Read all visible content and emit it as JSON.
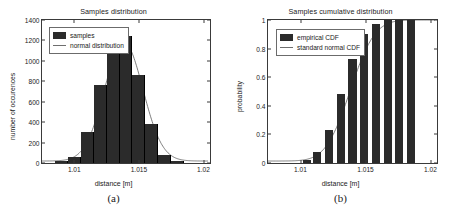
{
  "figure": {
    "background": "#ffffff",
    "bar_color": "#2b2b2b",
    "curve_color": "#6e6e6e",
    "axis_color": "#3a3a3a"
  },
  "panels": [
    {
      "caption": "(a)",
      "title": "Samples distribution",
      "legend": [
        {
          "label": "samples",
          "marker": "filled-square"
        },
        {
          "label": "normal distribution",
          "marker": "line"
        }
      ]
    },
    {
      "caption": "(b)",
      "title": "Samples cumulative distribution",
      "legend": [
        {
          "label": "empirical CDF",
          "marker": "filled-square"
        },
        {
          "label": "standard normal CDF",
          "marker": "line"
        }
      ]
    }
  ],
  "chart_data": [
    {
      "type": "bar",
      "title": "Samples distribution",
      "xlabel": "distance [m]",
      "ylabel": "number of occurences",
      "xlim": [
        1.0075,
        1.0205
      ],
      "ylim": [
        0,
        1400
      ],
      "xticks": [
        1.01,
        1.015,
        1.02
      ],
      "xticklabels": [
        "1.01",
        "1.015",
        "1.02"
      ],
      "yticks": [
        0,
        200,
        400,
        600,
        800,
        1000,
        1200,
        1400
      ],
      "yticklabels": [
        "0",
        "200",
        "400",
        "600",
        "800",
        "1000",
        "1200",
        "1400"
      ],
      "grid": false,
      "legend_position": "upper-left",
      "bin_edges": [
        1.0085,
        1.0095,
        1.0105,
        1.0115,
        1.0125,
        1.0135,
        1.0145,
        1.0155,
        1.0165,
        1.0175,
        1.0185
      ],
      "bin_centers": [
        1.009,
        1.01,
        1.011,
        1.012,
        1.013,
        1.014,
        1.015,
        1.016,
        1.017,
        1.018
      ],
      "values": [
        20,
        55,
        300,
        760,
        1240,
        1240,
        860,
        380,
        80,
        20
      ],
      "series": [
        {
          "name": "samples",
          "type": "bar",
          "values": [
            20,
            55,
            300,
            760,
            1240,
            1240,
            860,
            380,
            80,
            20
          ]
        },
        {
          "name": "normal distribution",
          "type": "line",
          "mean": 1.0139,
          "sigma": 0.0015,
          "peak": 1180
        }
      ]
    },
    {
      "type": "bar",
      "title": "Samples cumulative distribution",
      "xlabel": "distance [m]",
      "ylabel": "probability",
      "xlim": [
        1.0075,
        1.0205
      ],
      "ylim": [
        0,
        1
      ],
      "xticks": [
        1.01,
        1.015,
        1.02
      ],
      "xticklabels": [
        "1.01",
        "1.015",
        "1.02"
      ],
      "yticks": [
        0,
        0.2,
        0.4,
        0.6,
        0.8,
        1
      ],
      "yticklabels": [
        "0",
        "0.2",
        "0.4",
        "0.6",
        "0.8",
        "1"
      ],
      "grid": false,
      "legend_position": "upper-left",
      "bin_centers": [
        1.0105,
        1.0113,
        1.0122,
        1.0131,
        1.014,
        1.0149,
        1.0158,
        1.0167,
        1.0176,
        1.0185
      ],
      "values": [
        0.02,
        0.08,
        0.23,
        0.48,
        0.73,
        0.9,
        0.97,
        1.0,
        1.0,
        1.0
      ],
      "series": [
        {
          "name": "empirical CDF",
          "type": "bar",
          "values": [
            0.02,
            0.08,
            0.23,
            0.48,
            0.73,
            0.9,
            0.97,
            1.0,
            1.0,
            1.0
          ]
        },
        {
          "name": "standard normal CDF",
          "type": "line",
          "mean": 1.0139,
          "sigma": 0.0015
        }
      ]
    }
  ]
}
